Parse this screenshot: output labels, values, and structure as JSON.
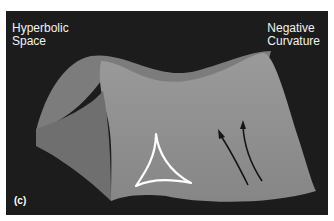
{
  "figure": {
    "label_top_left": [
      "Hyperbolic",
      "Space"
    ],
    "label_top_right": [
      "Negative",
      "Curvature"
    ],
    "panel_label": "(c)",
    "colors": {
      "background": "#1c1c1c",
      "surface": "#8a8a8a",
      "surface_light": "#9c9c9c",
      "surface_dark": "#6e6e6e",
      "triangle": "#ffffff",
      "arrows": "#1a1a1a"
    }
  }
}
